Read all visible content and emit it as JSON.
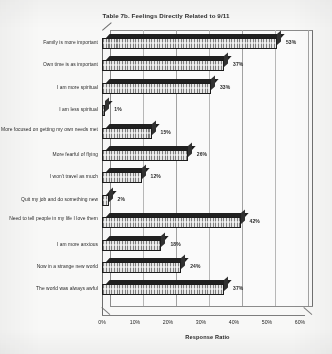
{
  "chart_data": {
    "type": "bar",
    "orientation": "horizontal",
    "title": "Table 7b. Feelings Directly Related to 9/11",
    "xlabel": "Response Ratio",
    "ylabel": "",
    "xlim": [
      0,
      60
    ],
    "xticks": [
      "0%",
      "10%",
      "20%",
      "30%",
      "40%",
      "50%",
      "60%"
    ],
    "xtick_values": [
      0,
      10,
      20,
      30,
      40,
      50,
      60
    ],
    "grid": true,
    "legend": "none",
    "style": "3d-bar",
    "value_suffix": "%",
    "categories": [
      "Family is more important",
      "Own time is as important",
      "I am more spiritual",
      "I am less spiritual",
      "More focused on getting my own needs met",
      "More fearful of flying",
      "I won't travel as much",
      "Quit my job and do something new",
      "Need to tell people in my life I love them",
      "I am more anxious",
      "Now in a strange new world",
      "The world was always awful"
    ],
    "values": [
      53,
      37,
      33,
      1,
      15,
      26,
      12,
      2,
      42,
      18,
      24,
      37
    ],
    "data_labels": [
      "53%",
      "37%",
      "33%",
      "1%",
      "15%",
      "26%",
      "12%",
      "2%",
      "42%",
      "18%",
      "24%",
      "37%"
    ]
  },
  "colors": {
    "bar_fill": "#9a9a9a",
    "bar_outline": "#141414",
    "grid": "#b9b9b9",
    "axis": "#6a6a6a",
    "text": "#1c1c1c",
    "background": "#fdfdfc"
  }
}
